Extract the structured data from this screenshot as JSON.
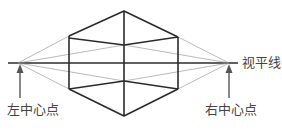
{
  "diagram": {
    "type": "two-point-perspective",
    "labels": {
      "horizon": "视平线",
      "left_vanishing_point": "左中心点",
      "right_vanishing_point": "右中心点"
    },
    "colors": {
      "thick_line": "#2b2b2b",
      "thin_line": "#8a8a8a",
      "arrow": "#555555",
      "text": "#444444"
    }
  }
}
